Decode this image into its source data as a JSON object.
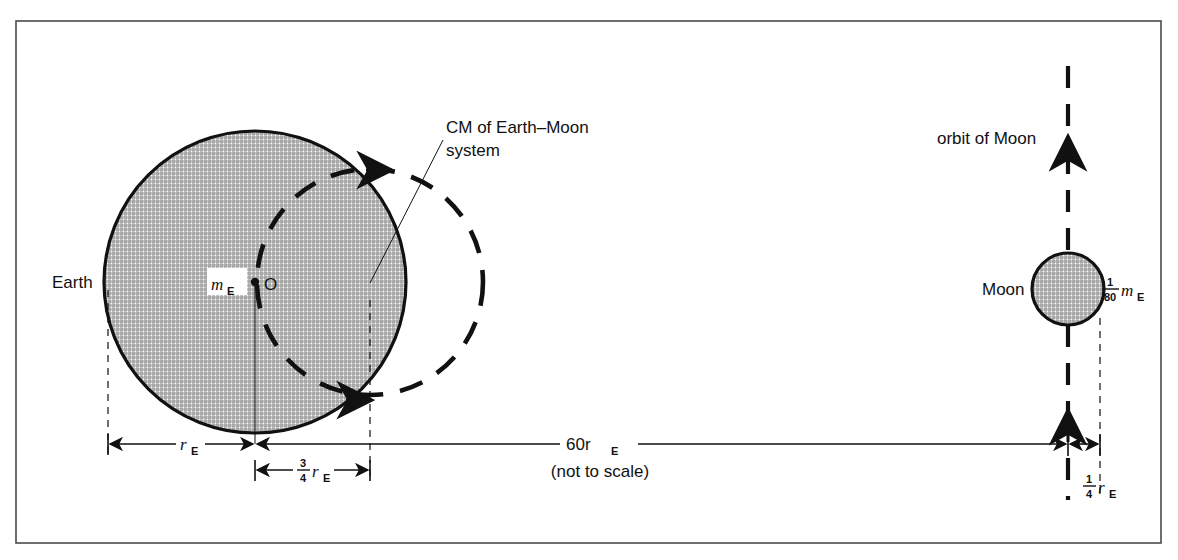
{
  "figure": {
    "frame_color": "#4a4a4a",
    "ink_color": "#111111",
    "body_fill_color": "#d6d6d6",
    "background_color": "#ffffff"
  },
  "labels": {
    "earth": "Earth",
    "moon": "Moon",
    "earth_mass_symbol": "m",
    "earth_mass_subscript": "E",
    "earth_center_point": "O",
    "cm_line1": "CM of Earth–Moon",
    "cm_line2": "system",
    "orbit_of_moon": "orbit of Moon",
    "moon_mass_numerator": "1",
    "moon_mass_denominator": "80",
    "moon_mass_symbol": "m",
    "moon_mass_subscript": "E"
  },
  "dimensions": {
    "earth_radius": {
      "value": "r",
      "subscript": "E",
      "description": "Earth radius"
    },
    "cm_offset": {
      "numerator": "3",
      "denominator": "4",
      "value": "r",
      "subscript": "E",
      "description": "distance from Earth center to CM"
    },
    "earth_moon_distance": {
      "value": "60r",
      "subscript": "E",
      "note": "(not to scale)",
      "description": "Earth-Moon separation"
    },
    "moon_offset": {
      "numerator": "1",
      "denominator": "4",
      "value": "r",
      "subscript": "E",
      "description": "small offset at Moon"
    }
  },
  "geometry": {
    "frame": {
      "x": 16,
      "y": 21,
      "width": 1145,
      "height": 522
    },
    "earth": {
      "cx": 255,
      "cy": 282,
      "r": 151
    },
    "moon": {
      "cx": 1068,
      "cy": 289,
      "r": 36
    },
    "cm_circle": {
      "cx": 370,
      "cy": 282,
      "r": 113
    },
    "cm_point": {
      "x": 370,
      "y": 282
    },
    "baseline_y": 444,
    "sub_dim_y": 470
  }
}
